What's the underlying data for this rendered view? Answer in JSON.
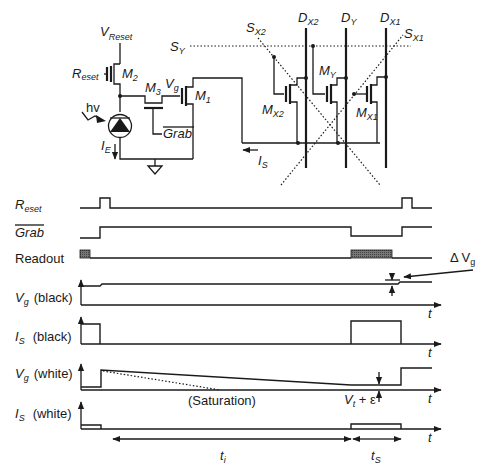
{
  "circuit": {
    "labels": {
      "v_reset": "V",
      "v_reset_sub": "Reset",
      "reset": "R",
      "reset_sub": "eset",
      "m2": "M",
      "m2_sub": "2",
      "m3": "M",
      "m3_sub": "3",
      "vg": "V",
      "vg_sub": "g",
      "m1": "M",
      "m1_sub": "1",
      "hv": "hv",
      "grab": "Grab",
      "ie": "I",
      "ie_sub": "E",
      "is": "I",
      "is_sub": "S",
      "sy": "S",
      "sy_sub": "Y",
      "sx2": "S",
      "sx2_sub": "X2",
      "sx1": "S",
      "sx1_sub": "X1",
      "dx2": "D",
      "dx2_sub": "X2",
      "dy": "D",
      "dy_sub": "Y",
      "dx1": "D",
      "dx1_sub": "X1",
      "mx2": "M",
      "mx2_sub": "X2",
      "my": "M",
      "my_sub": "Y",
      "mx1": "M",
      "mx1_sub": "X1"
    }
  },
  "timing": {
    "rows": [
      {
        "label": "R",
        "label_sub": "eset",
        "italic": true
      },
      {
        "label": "Grab",
        "overbar": true,
        "italic": true
      },
      {
        "label": "Readout",
        "italic": false
      },
      {
        "label": "V",
        "label_sub": "g",
        "suffix": "(black)"
      },
      {
        "label": "I",
        "label_sub": "S",
        "suffix": "(black)"
      },
      {
        "label": "V",
        "label_sub": "g",
        "suffix": "(white)"
      },
      {
        "label": "I",
        "label_sub": "S",
        "suffix": "(white)"
      }
    ],
    "axis_label": "t",
    "annotations": {
      "delta_vg": "Δ V",
      "delta_vg_sub": "g",
      "saturation": "(Saturation)",
      "vt_eps": "V",
      "vt_eps_sub": "t",
      "vt_eps_rest": " + ε",
      "ti": "t",
      "ti_sub": "i",
      "ts": "t",
      "ts_sub": "S"
    }
  }
}
